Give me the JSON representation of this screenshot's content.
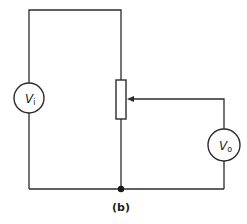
{
  "diagram": {
    "type": "circuit-schematic",
    "caption": "(b)",
    "components": {
      "input_source": {
        "label_main": "V",
        "label_sub": "i"
      },
      "output_meter": {
        "label_main": "V",
        "label_sub": "o"
      },
      "potentiometer": {
        "label": ""
      }
    },
    "colors": {
      "line": "#2b2b2b",
      "background": "#ffffff"
    }
  }
}
